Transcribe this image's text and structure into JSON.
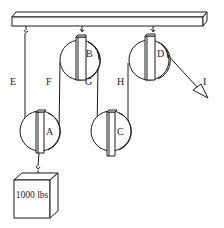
{
  "diagram": {
    "weight_label": "1000 lbs",
    "pulleys": [
      {
        "id": "A",
        "label": "A",
        "type": "movable"
      },
      {
        "id": "B",
        "label": "B",
        "type": "fixed"
      },
      {
        "id": "C",
        "label": "C",
        "type": "movable"
      },
      {
        "id": "D",
        "label": "D",
        "type": "fixed"
      }
    ],
    "rope_segments": [
      {
        "id": "E",
        "label": "E"
      },
      {
        "id": "F",
        "label": "F"
      },
      {
        "id": "G",
        "label": "G"
      },
      {
        "id": "H",
        "label": "H"
      },
      {
        "id": "I",
        "label": "I"
      }
    ],
    "colors": {
      "ink": "#1a1a1a",
      "background": "#ffffff"
    }
  }
}
